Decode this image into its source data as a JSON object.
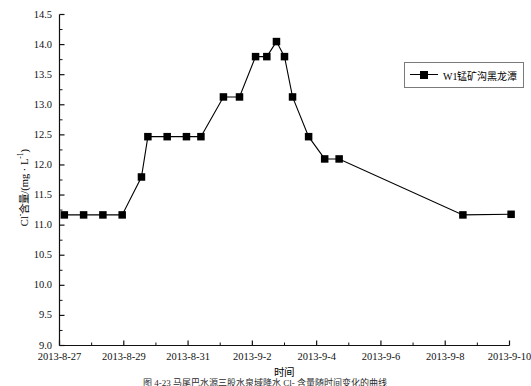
{
  "chart_data": {
    "type": "line",
    "title": "",
    "xlabel": "时间",
    "ylabel_parts": {
      "prefix": "Cl",
      "sup1": "-",
      "mid": "含量/(mg · L",
      "sup2": "-1",
      "suffix": ")"
    },
    "ylabel": "Cl-含量/(mg · L-1)",
    "ylim": [
      9.0,
      14.5
    ],
    "ytick_labels": [
      "14.5",
      "14.0",
      "13.5",
      "13.0",
      "12.5",
      "12.0",
      "11.5",
      "11.0",
      "10.5",
      "10.0",
      "9.5",
      "9.0"
    ],
    "ytick_values": [
      14.5,
      14.0,
      13.5,
      13.0,
      12.5,
      12.0,
      11.5,
      11.0,
      10.5,
      10.0,
      9.5,
      9.0
    ],
    "yminor_step": 0.25,
    "xtick_labels": [
      "2013-8-27",
      "2013-8-29",
      "2013-8-31",
      "2013-9-2",
      "2013-9-4",
      "2013-9-6",
      "2013-9-8",
      "2013-9-10"
    ],
    "xtick_days": [
      0,
      2,
      4,
      6,
      8,
      10,
      12,
      14
    ],
    "xlim_days": [
      -0.1,
      14.4
    ],
    "xminor_step_days": 1,
    "grid": false,
    "legend_position": "top-right",
    "series": [
      {
        "name": "W1锰矿沟黑龙潭",
        "color": "#000000",
        "marker": "square",
        "x_days": [
          0.15,
          0.75,
          1.35,
          1.95,
          2.55,
          2.75,
          3.35,
          3.95,
          4.4,
          5.1,
          5.6,
          6.1,
          6.45,
          6.75,
          7.0,
          7.25,
          7.75,
          8.25,
          8.7,
          12.55,
          14.05
        ],
        "x_labels": [
          "2013-8-27",
          "2013-8-27",
          "2013-8-28",
          "2013-8-29",
          "2013-8-29",
          "2013-8-29",
          "2013-8-30",
          "2013-8-31",
          "2013-8-31",
          "2013-9-1",
          "2013-9-1",
          "2013-9-2",
          "2013-9-2",
          "2013-9-2",
          "2013-9-3",
          "2013-9-3",
          "2013-9-3",
          "2013-9-4",
          "2013-9-4",
          "2013-9-8",
          "2013-9-10"
        ],
        "values": [
          11.17,
          11.17,
          11.17,
          11.17,
          11.8,
          12.47,
          12.47,
          12.47,
          12.47,
          13.13,
          13.13,
          13.8,
          13.8,
          14.05,
          13.8,
          13.13,
          12.47,
          12.1,
          12.1,
          11.17,
          11.18
        ]
      }
    ]
  },
  "caption": "图 4-23   马尾巴水源三股水泉域降水 Cl- 含量随时间变化的曲线"
}
